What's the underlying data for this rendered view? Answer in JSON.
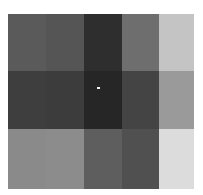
{
  "grid": {
    "columns": [
      0,
      38,
      76,
      114,
      151,
      186
    ],
    "rows": [
      0,
      57,
      115,
      175
    ],
    "tiles": [
      [
        "#5a5a5a",
        "#555555",
        "#2e2e2e",
        "#6e6e6e",
        "#c4c4c4"
      ],
      [
        "#3e3e3e",
        "#3c3c3c",
        "#262626",
        "#444444",
        "#9a9a9a"
      ],
      [
        "#8a8a8a",
        "#8c8c8c",
        "#5e5e5e",
        "#505050",
        "#dcdcdc"
      ]
    ]
  },
  "marker": {
    "x": 97,
    "y": 87,
    "color": "#f2f2f2"
  }
}
